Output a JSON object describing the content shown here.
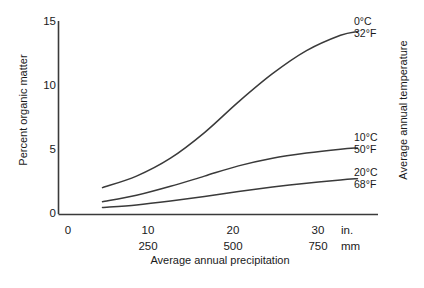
{
  "chart_data": {
    "type": "line",
    "title": "",
    "xlabel": "Average annual precipitation",
    "ylabel": "Percent organic matter",
    "rlabel": "Average annual temperature",
    "xlim": [
      0,
      35
    ],
    "ylim": [
      0,
      15
    ],
    "grid": false,
    "legend_position": "right-inline-annotations",
    "y_ticks": [
      "0",
      "5",
      "10",
      "15"
    ],
    "y_tick_values": [
      0,
      5,
      10,
      15
    ],
    "x_ticks_in": [
      "0",
      "10",
      "20",
      "30"
    ],
    "x_tick_values_in": [
      0,
      10,
      20,
      30
    ],
    "x_ticks_mm": [
      "",
      "250",
      "500",
      "750"
    ],
    "x_unit_in": "in.",
    "x_unit_mm": "mm",
    "series": [
      {
        "name": "0°C / 32°F",
        "label_line1": "0°C",
        "label_line2": "32°F",
        "x": [
          4,
          8,
          12,
          16,
          20,
          24,
          28,
          32,
          34
        ],
        "values": [
          2.1,
          3.0,
          4.4,
          6.4,
          8.8,
          11.0,
          12.8,
          14.0,
          14.3
        ]
      },
      {
        "name": "10°C / 50°F",
        "label_line1": "10°C",
        "label_line2": "50°F",
        "x": [
          4,
          8,
          12,
          16,
          20,
          24,
          28,
          32,
          34
        ],
        "values": [
          1.0,
          1.5,
          2.2,
          3.0,
          3.8,
          4.4,
          4.8,
          5.1,
          5.2
        ]
      },
      {
        "name": "20°C / 68°F",
        "label_line1": "20°C",
        "label_line2": "68°F",
        "x": [
          4,
          8,
          12,
          16,
          20,
          24,
          28,
          32,
          34
        ],
        "values": [
          0.55,
          0.75,
          1.05,
          1.4,
          1.8,
          2.15,
          2.45,
          2.7,
          2.8
        ]
      }
    ],
    "colors": {
      "line": "#3a3a3a",
      "axis": "#3a3a3a",
      "text": "#1a1a1a",
      "background": "#ffffff"
    }
  },
  "ticks": {
    "y": {
      "t0": "0",
      "t5": "5",
      "t10": "10",
      "t15": "15"
    },
    "x_in": {
      "t0": "0",
      "t10": "10",
      "t20": "20",
      "t30": "30",
      "unit": "in."
    },
    "x_mm": {
      "t250": "250",
      "t500": "500",
      "t750": "750",
      "unit": "mm"
    }
  },
  "labels": {
    "y_axis_title": "Percent organic matter",
    "x_axis_title": "Average annual precipitation",
    "right_axis_title": "Average annual temperature",
    "curve1_top": "0°C",
    "curve1_bottom": "32°F",
    "curve2_top": "10°C",
    "curve2_bottom": "50°F",
    "curve3_top": "20°C",
    "curve3_bottom": "68°F"
  }
}
